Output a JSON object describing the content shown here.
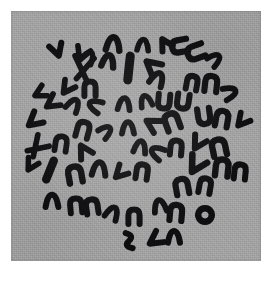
{
  "image": {
    "kind": "micrograph",
    "subject": "metaphase-chromosome-spread",
    "title": "Metaphase chromosome spread",
    "width": 280,
    "height": 282,
    "background_color": "#ffffff"
  },
  "panel": {
    "x": 11,
    "y": 11,
    "width": 250,
    "height": 250,
    "background_color": "#a2a2a2",
    "grain": true,
    "label": "micrograph field"
  },
  "staining": {
    "chromosome_color": "#0e0e10",
    "background_color": "#a2a2a2",
    "contrast": "high",
    "modality": "brightfield-giemsa"
  },
  "spread": {
    "center_x": 132,
    "center_y": 140,
    "radius_x": 104,
    "radius_y": 104,
    "count_label": "46",
    "notes": "chromosomes scattered in a roughly circular metaphase plate"
  },
  "chart_data": {
    "type": "scatter",
    "title": "Metaphase chromosome spread",
    "xlabel": "",
    "ylabel": "",
    "xlim": [
      11,
      261
    ],
    "ylim": [
      11,
      261
    ],
    "grid": false,
    "legend": null,
    "objects": [
      {
        "id": 1,
        "x": 57,
        "y": 50,
        "len": 15,
        "w": 6.0,
        "rot": -18,
        "form": "v",
        "label": "chromosome"
      },
      {
        "id": 2,
        "x": 82,
        "y": 54,
        "len": 16,
        "w": 5.6,
        "rot": 22,
        "form": "v",
        "label": "chromosome"
      },
      {
        "id": 3,
        "x": 83,
        "y": 68,
        "len": 24,
        "w": 5.6,
        "rot": 8,
        "form": "x",
        "label": "chromosome"
      },
      {
        "id": 4,
        "x": 113,
        "y": 45,
        "len": 17,
        "w": 6.4,
        "rot": 95,
        "form": "c",
        "label": "chromosome"
      },
      {
        "id": 5,
        "x": 165,
        "y": 44,
        "len": 14,
        "w": 6.0,
        "rot": 150,
        "form": "v",
        "label": "chromosome"
      },
      {
        "id": 6,
        "x": 180,
        "y": 46,
        "len": 17,
        "w": 6.2,
        "rot": 80,
        "form": "u",
        "label": "chromosome"
      },
      {
        "id": 7,
        "x": 196,
        "y": 52,
        "len": 18,
        "w": 6.2,
        "rot": 70,
        "form": "u",
        "label": "chromosome"
      },
      {
        "id": 8,
        "x": 108,
        "y": 62,
        "len": 15,
        "w": 6.4,
        "rot": 100,
        "form": "c",
        "label": "chromosome"
      },
      {
        "id": 9,
        "x": 129,
        "y": 68,
        "len": 26,
        "w": 9.0,
        "rot": 6,
        "form": "rod",
        "label": "chromosome"
      },
      {
        "id": 10,
        "x": 152,
        "y": 66,
        "len": 18,
        "w": 6.2,
        "rot": 130,
        "form": "v",
        "label": "chromosome"
      },
      {
        "id": 11,
        "x": 157,
        "y": 80,
        "len": 16,
        "w": 6.0,
        "rot": 115,
        "form": "c",
        "label": "chromosome"
      },
      {
        "id": 12,
        "x": 192,
        "y": 83,
        "len": 15,
        "w": 6.0,
        "rot": 10,
        "form": "n",
        "label": "chromosome"
      },
      {
        "id": 13,
        "x": 211,
        "y": 84,
        "len": 17,
        "w": 6.2,
        "rot": 6,
        "form": "n",
        "label": "chromosome"
      },
      {
        "id": 14,
        "x": 229,
        "y": 93,
        "len": 15,
        "w": 5.8,
        "rot": 160,
        "form": "c",
        "label": "chromosome"
      },
      {
        "id": 15,
        "x": 67,
        "y": 88,
        "len": 15,
        "w": 5.8,
        "rot": 35,
        "form": "v",
        "label": "chromosome"
      },
      {
        "id": 16,
        "x": 90,
        "y": 89,
        "len": 16,
        "w": 6.0,
        "rot": 0,
        "form": "n",
        "label": "chromosome"
      },
      {
        "id": 17,
        "x": 52,
        "y": 103,
        "len": 16,
        "w": 5.8,
        "rot": 55,
        "form": "v",
        "label": "chromosome"
      },
      {
        "id": 18,
        "x": 73,
        "y": 106,
        "len": 15,
        "w": 5.8,
        "rot": 120,
        "form": "c",
        "label": "chromosome"
      },
      {
        "id": 19,
        "x": 96,
        "y": 106,
        "len": 15,
        "w": 5.8,
        "rot": 25,
        "form": "c",
        "label": "chromosome"
      },
      {
        "id": 20,
        "x": 124,
        "y": 105,
        "len": 15,
        "w": 5.8,
        "rot": 95,
        "form": "c",
        "label": "chromosome"
      },
      {
        "id": 21,
        "x": 146,
        "y": 102,
        "len": 14,
        "w": 5.6,
        "rot": 75,
        "form": "c",
        "label": "chromosome"
      },
      {
        "id": 22,
        "x": 164,
        "y": 101,
        "len": 16,
        "w": 6.0,
        "rot": 5,
        "form": "u",
        "label": "chromosome"
      },
      {
        "id": 23,
        "x": 183,
        "y": 101,
        "len": 16,
        "w": 6.0,
        "rot": 8,
        "form": "u",
        "label": "chromosome"
      },
      {
        "id": 24,
        "x": 204,
        "y": 116,
        "len": 17,
        "w": 6.2,
        "rot": 172,
        "form": "n",
        "label": "chromosome"
      },
      {
        "id": 25,
        "x": 222,
        "y": 119,
        "len": 17,
        "w": 6.2,
        "rot": 10,
        "form": "n",
        "label": "chromosome"
      },
      {
        "id": 26,
        "x": 242,
        "y": 121,
        "len": 15,
        "w": 5.8,
        "rot": 40,
        "form": "v",
        "label": "chromosome"
      },
      {
        "id": 27,
        "x": 34,
        "y": 121,
        "len": 17,
        "w": 6.0,
        "rot": 50,
        "form": "v",
        "label": "chromosome"
      },
      {
        "id": 28,
        "x": 83,
        "y": 130,
        "len": 17,
        "w": 6.0,
        "rot": 15,
        "form": "n",
        "label": "chromosome"
      },
      {
        "id": 29,
        "x": 105,
        "y": 132,
        "len": 14,
        "w": 5.6,
        "rot": 140,
        "form": "c",
        "label": "chromosome"
      },
      {
        "id": 30,
        "x": 128,
        "y": 129,
        "len": 15,
        "w": 5.8,
        "rot": 90,
        "form": "c",
        "label": "chromosome"
      },
      {
        "id": 31,
        "x": 152,
        "y": 124,
        "len": 16,
        "w": 6.0,
        "rot": 120,
        "form": "v",
        "label": "chromosome"
      },
      {
        "id": 32,
        "x": 172,
        "y": 122,
        "len": 18,
        "w": 6.4,
        "rot": 160,
        "form": "u",
        "label": "chromosome"
      },
      {
        "id": 33,
        "x": 37,
        "y": 147,
        "len": 20,
        "w": 5.6,
        "rot": 45,
        "form": "x",
        "label": "chromosome"
      },
      {
        "id": 34,
        "x": 61,
        "y": 144,
        "len": 16,
        "w": 5.8,
        "rot": 8,
        "form": "n",
        "label": "chromosome"
      },
      {
        "id": 35,
        "x": 84,
        "y": 151,
        "len": 16,
        "w": 6.0,
        "rot": 150,
        "form": "v",
        "label": "chromosome"
      },
      {
        "id": 36,
        "x": 140,
        "y": 148,
        "len": 15,
        "w": 5.8,
        "rot": 100,
        "form": "c",
        "label": "chromosome"
      },
      {
        "id": 37,
        "x": 158,
        "y": 153,
        "len": 15,
        "w": 5.8,
        "rot": 30,
        "form": "c",
        "label": "chromosome"
      },
      {
        "id": 38,
        "x": 176,
        "y": 148,
        "len": 16,
        "w": 6.0,
        "rot": 5,
        "form": "n",
        "label": "chromosome"
      },
      {
        "id": 39,
        "x": 198,
        "y": 143,
        "len": 16,
        "w": 6.0,
        "rot": 30,
        "form": "v",
        "label": "chromosome"
      },
      {
        "id": 40,
        "x": 219,
        "y": 148,
        "len": 18,
        "w": 6.4,
        "rot": 168,
        "form": "u",
        "label": "chromosome"
      },
      {
        "id": 41,
        "x": 50,
        "y": 170,
        "len": 22,
        "w": 8.4,
        "rot": 22,
        "form": "rod",
        "label": "chromosome"
      },
      {
        "id": 42,
        "x": 75,
        "y": 175,
        "len": 18,
        "w": 6.4,
        "rot": 170,
        "form": "u",
        "label": "chromosome"
      },
      {
        "id": 43,
        "x": 99,
        "y": 170,
        "len": 17,
        "w": 6.0,
        "rot": 95,
        "form": "c",
        "label": "chromosome"
      },
      {
        "id": 44,
        "x": 120,
        "y": 173,
        "len": 15,
        "w": 5.8,
        "rot": 45,
        "form": "v",
        "label": "chromosome"
      },
      {
        "id": 45,
        "x": 142,
        "y": 172,
        "len": 16,
        "w": 6.0,
        "rot": 8,
        "form": "n",
        "label": "chromosome"
      },
      {
        "id": 46,
        "x": 196,
        "y": 165,
        "len": 20,
        "w": 6.6,
        "rot": 30,
        "form": "v",
        "label": "chromosome"
      },
      {
        "id": 47,
        "x": 222,
        "y": 168,
        "len": 18,
        "w": 6.4,
        "rot": 6,
        "form": "n",
        "label": "chromosome"
      },
      {
        "id": 48,
        "x": 240,
        "y": 172,
        "len": 16,
        "w": 6.0,
        "rot": 6,
        "form": "n",
        "label": "chromosome"
      },
      {
        "id": 49,
        "x": 52,
        "y": 202,
        "len": 16,
        "w": 6.0,
        "rot": 90,
        "form": "c",
        "label": "chromosome"
      },
      {
        "id": 50,
        "x": 76,
        "y": 206,
        "len": 16,
        "w": 6.0,
        "rot": 175,
        "form": "u",
        "label": "chromosome"
      },
      {
        "id": 51,
        "x": 92,
        "y": 207,
        "len": 16,
        "w": 6.0,
        "rot": 172,
        "form": "u",
        "label": "chromosome"
      },
      {
        "id": 52,
        "x": 112,
        "y": 214,
        "len": 15,
        "w": 5.8,
        "rot": 115,
        "form": "c",
        "label": "chromosome"
      },
      {
        "id": 53,
        "x": 134,
        "y": 217,
        "len": 16,
        "w": 6.0,
        "rot": 0,
        "form": "n",
        "label": "chromosome"
      },
      {
        "id": 54,
        "x": 160,
        "y": 207,
        "len": 15,
        "w": 5.8,
        "rot": 80,
        "form": "c",
        "label": "chromosome"
      },
      {
        "id": 55,
        "x": 176,
        "y": 213,
        "len": 17,
        "w": 6.2,
        "rot": 5,
        "form": "n",
        "label": "chromosome"
      },
      {
        "id": 56,
        "x": 182,
        "y": 187,
        "len": 17,
        "w": 6.2,
        "rot": 170,
        "form": "u",
        "label": "chromosome"
      },
      {
        "id": 57,
        "x": 205,
        "y": 186,
        "len": 16,
        "w": 6.0,
        "rot": 10,
        "form": "n",
        "label": "chromosome"
      },
      {
        "id": 58,
        "x": 205,
        "y": 215,
        "len": 16,
        "w": 6.4,
        "rot": 0,
        "form": "ring",
        "label": "chromosome"
      },
      {
        "id": 59,
        "x": 129,
        "y": 241,
        "len": 16,
        "w": 6.0,
        "rot": 30,
        "form": "s",
        "label": "chromosome"
      },
      {
        "id": 60,
        "x": 155,
        "y": 240,
        "len": 16,
        "w": 6.0,
        "rot": 55,
        "form": "v",
        "label": "chromosome"
      },
      {
        "id": 61,
        "x": 174,
        "y": 238,
        "len": 15,
        "w": 6.0,
        "rot": 90,
        "form": "c",
        "label": "chromosome"
      },
      {
        "id": 62,
        "x": 88,
        "y": 58,
        "len": 14,
        "w": 5.6,
        "rot": 120,
        "form": "c",
        "label": "chromosome"
      },
      {
        "id": 63,
        "x": 40,
        "y": 93,
        "len": 14,
        "w": 5.6,
        "rot": 62,
        "form": "v",
        "label": "chromosome"
      },
      {
        "id": 64,
        "x": 31,
        "y": 165,
        "len": 14,
        "w": 5.6,
        "rot": 30,
        "form": "v",
        "label": "chromosome"
      },
      {
        "id": 65,
        "x": 143,
        "y": 46,
        "len": 14,
        "w": 5.6,
        "rot": 95,
        "form": "c",
        "label": "chromosome"
      },
      {
        "id": 66,
        "x": 214,
        "y": 60,
        "len": 14,
        "w": 5.6,
        "rot": 140,
        "form": "c",
        "label": "chromosome"
      }
    ]
  }
}
